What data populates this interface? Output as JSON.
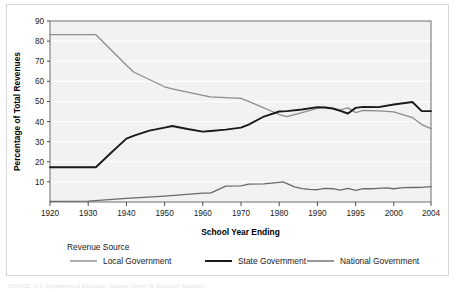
{
  "figure": {
    "plot_background": "#f2f2f2",
    "frame_color": "#d8d8d8",
    "source_note": "SOURCE: U.S. Department of Education, National Center for Education Statistics"
  },
  "axes": {
    "y_axis_title": "Percentage of Total Revenues",
    "x_axis_title": "School Year Ending",
    "y_ticks": [
      "10",
      "20",
      "30",
      "40",
      "50",
      "60",
      "70",
      "80",
      "90"
    ],
    "x_ticks": [
      "1920",
      "1930",
      "1940",
      "1950",
      "1960",
      "1970",
      "1980",
      "1990",
      "1995",
      "2000",
      "2004"
    ]
  },
  "legend": {
    "heading": "Revenue Source",
    "entries": [
      {
        "label": "Local Government",
        "color": "#8c8c8c"
      },
      {
        "label": "State Government",
        "color": "#1a1a1a"
      },
      {
        "label": "National Government",
        "color": "#6a6a6a"
      }
    ]
  },
  "chart_data": {
    "type": "line",
    "title": "",
    "xlabel": "School Year Ending",
    "ylabel": "Percentage of Total Revenues",
    "xlim": [
      1920,
      2004
    ],
    "ylim": [
      0,
      90
    ],
    "grid": true,
    "legend_position": "bottom",
    "x_tick_values": [
      1920,
      1930,
      1940,
      1950,
      1960,
      1970,
      1980,
      1990,
      1995,
      2000,
      2004
    ],
    "y_tick_values": [
      10,
      20,
      30,
      40,
      50,
      60,
      70,
      80,
      90
    ],
    "series": [
      {
        "name": "Local Government",
        "color": "#8c8c8c",
        "x": [
          1920,
          1930,
          1932,
          1940,
          1942,
          1950,
          1952,
          1960,
          1962,
          1970,
          1972,
          1980,
          1982,
          1986,
          1990,
          1991,
          1992,
          1993,
          1994,
          1995,
          1996,
          1998,
          2000,
          2002,
          2003,
          2004
        ],
        "y": [
          83.2,
          83.2,
          83.2,
          68.0,
          64.5,
          57.3,
          56.3,
          53.0,
          52.3,
          51.5,
          50.0,
          43.5,
          42.4,
          44.5,
          46.6,
          47.0,
          46.5,
          45.8,
          46.8,
          44.5,
          45.5,
          45.3,
          44.8,
          42.0,
          38.5,
          36.5
        ]
      },
      {
        "name": "State Government",
        "color": "#1a1a1a",
        "x": [
          1920,
          1930,
          1932,
          1936,
          1940,
          1942,
          1946,
          1950,
          1952,
          1956,
          1960,
          1962,
          1966,
          1970,
          1972,
          1976,
          1980,
          1982,
          1986,
          1990,
          1991,
          1992,
          1993,
          1994,
          1995,
          1996,
          1998,
          2000,
          2002,
          2003,
          2004
        ],
        "y": [
          17.3,
          17.3,
          17.3,
          24.5,
          31.5,
          33.0,
          35.5,
          37.0,
          37.8,
          36.3,
          35.0,
          35.3,
          36.0,
          37.0,
          38.5,
          42.5,
          45.0,
          45.2,
          46.0,
          47.2,
          47.0,
          46.5,
          45.3,
          44.0,
          46.8,
          47.3,
          47.2,
          48.5,
          49.7,
          45.2,
          45.2
        ]
      },
      {
        "name": "National Government",
        "color": "#6a6a6a",
        "x": [
          1920,
          1930,
          1940,
          1950,
          1960,
          1962,
          1966,
          1970,
          1972,
          1976,
          1980,
          1981,
          1984,
          1986,
          1988,
          1990,
          1991,
          1992,
          1993,
          1994,
          1995,
          1996,
          1997,
          1998,
          1999,
          2000,
          2001,
          2002,
          2003,
          2004
        ],
        "y": [
          0.3,
          0.4,
          1.8,
          2.9,
          4.4,
          4.4,
          7.9,
          8.0,
          8.9,
          9.0,
          9.8,
          10.0,
          7.5,
          6.7,
          6.3,
          6.1,
          6.8,
          6.6,
          5.9,
          6.8,
          5.8,
          6.6,
          6.6,
          6.8,
          7.0,
          6.6,
          7.1,
          7.2,
          7.3,
          7.6
        ]
      }
    ]
  }
}
